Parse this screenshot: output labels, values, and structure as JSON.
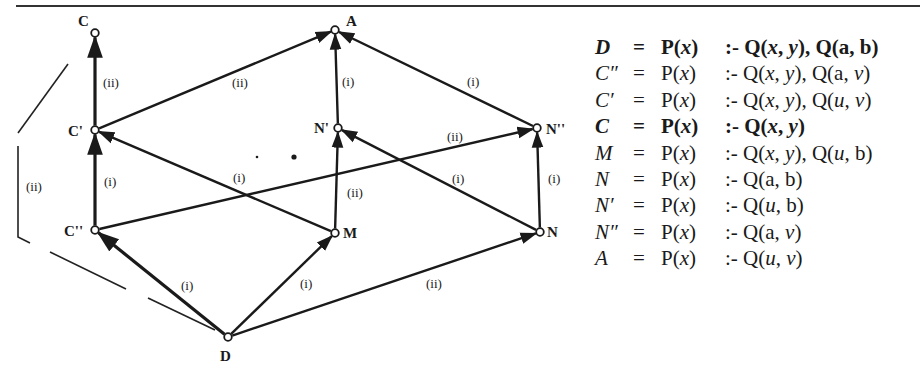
{
  "figure": {
    "nodes": [
      {
        "id": "C",
        "label": "C",
        "x": 95,
        "y": 33,
        "lx": 78,
        "ly": 26
      },
      {
        "id": "C1",
        "label": "C'",
        "x": 95,
        "y": 130,
        "lx": 68,
        "ly": 136
      },
      {
        "id": "C2",
        "label": "C''",
        "x": 95,
        "y": 230,
        "lx": 64,
        "ly": 236
      },
      {
        "id": "D",
        "label": "D",
        "x": 228,
        "y": 337,
        "lx": 220,
        "ly": 361
      },
      {
        "id": "M",
        "label": "M",
        "x": 335,
        "y": 233,
        "lx": 343,
        "ly": 238
      },
      {
        "id": "N1",
        "label": "N'",
        "x": 338,
        "y": 128,
        "lx": 314,
        "ly": 133
      },
      {
        "id": "A",
        "label": "A",
        "x": 335,
        "y": 30,
        "lx": 346,
        "ly": 26
      },
      {
        "id": "N2",
        "label": "N''",
        "x": 537,
        "y": 128,
        "lx": 546,
        "ly": 134
      },
      {
        "id": "N",
        "label": "N",
        "x": 540,
        "y": 232,
        "lx": 547,
        "ly": 237
      }
    ],
    "edges": [
      {
        "from": "C1",
        "to": "C",
        "label": "(ii)",
        "lx": 103,
        "ly": 87,
        "bold": true
      },
      {
        "from": "C2",
        "to": "C1",
        "label": "(i)",
        "lx": 104,
        "ly": 186,
        "bold": true
      },
      {
        "from": "D",
        "to": "C2",
        "label": "(i)",
        "lx": 181,
        "ly": 290,
        "bold": true
      },
      {
        "from": "D",
        "to": "M",
        "label": "(i)",
        "lx": 300,
        "ly": 288,
        "bold": false
      },
      {
        "from": "D",
        "to": "N",
        "label": "(ii)",
        "lx": 426,
        "ly": 288,
        "bold": false
      },
      {
        "from": "C1",
        "to": "A",
        "label": "(ii)",
        "lx": 232,
        "ly": 87,
        "bold": false
      },
      {
        "from": "M",
        "to": "C1",
        "label": "(i)",
        "lx": 233,
        "ly": 182,
        "bold": false
      },
      {
        "from": "C2",
        "to": "N2",
        "label": "(ii)",
        "lx": 447,
        "ly": 141,
        "bold": false
      },
      {
        "from": "M",
        "to": "N1",
        "label": "(ii)",
        "lx": 347,
        "ly": 197,
        "bold": false
      },
      {
        "from": "N",
        "to": "N1",
        "label": "(i)",
        "lx": 452,
        "ly": 183,
        "bold": false
      },
      {
        "from": "N1",
        "to": "A",
        "label": "(i)",
        "lx": 342,
        "ly": 86,
        "bold": false
      },
      {
        "from": "N2",
        "to": "A",
        "label": "(i)",
        "lx": 467,
        "ly": 86,
        "bold": false
      },
      {
        "from": "N",
        "to": "N2",
        "label": "(i)",
        "lx": 548,
        "ly": 183,
        "bold": false
      }
    ],
    "side_bracket_label": "(ii)",
    "dots": [
      {
        "x": 257,
        "y": 157,
        "r": 1.3
      },
      {
        "x": 294,
        "y": 157,
        "r": 2.6
      }
    ]
  },
  "formulas": [
    {
      "name": "D",
      "eq": "=",
      "head": "P(x)",
      "body": ":- Q(x, y), Q(a, b)",
      "bold": true
    },
    {
      "name": "C″",
      "eq": "=",
      "head": "P(x)",
      "body": ":- Q(x, y), Q(a, v)",
      "bold": false
    },
    {
      "name": "C′",
      "eq": "=",
      "head": "P(x)",
      "body": ":- Q(x, y), Q(u, v)",
      "bold": false
    },
    {
      "name": "C",
      "eq": "=",
      "head": "P(x)",
      "body": ":- Q(x, y)",
      "bold": true
    },
    {
      "name": "M",
      "eq": "=",
      "head": "P(x)",
      "body": ":- Q(x, y), Q(u, b)",
      "bold": false
    },
    {
      "name": "N",
      "eq": "=",
      "head": "P(x)",
      "body": ":- Q(a, b)",
      "bold": false
    },
    {
      "name": "N′",
      "eq": "=",
      "head": "P(x)",
      "body": ":- Q(u, b)",
      "bold": false
    },
    {
      "name": "N″",
      "eq": "=",
      "head": "P(x)",
      "body": ":- Q(a, v)",
      "bold": false
    },
    {
      "name": "A",
      "eq": "=",
      "head": "P(x)",
      "body": ":- Q(u, v)",
      "bold": false
    }
  ]
}
